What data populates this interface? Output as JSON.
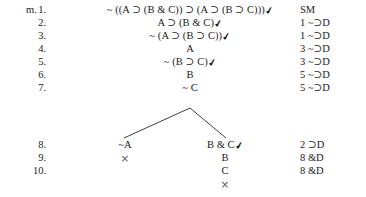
{
  "proof": {
    "tree_label": "m.",
    "checkmark_glyph": "✔",
    "close_glyph": "×",
    "stem_lines": [
      {
        "number": "1.",
        "formula": "~ ((A ⊃ (B & C)) ⊃ (A ⊃ (B ⊃ C)))",
        "checked": true,
        "justification": "SM"
      },
      {
        "number": "2.",
        "formula": "A ⊃ (B & C)",
        "checked": true,
        "justification": "1 ~⊃D"
      },
      {
        "number": "3.",
        "formula": "~ (A ⊃ (B ⊃ C))",
        "checked": true,
        "justification": "1 ~⊃D"
      },
      {
        "number": "4.",
        "formula": "A",
        "checked": false,
        "justification": "3 ~⊃D"
      },
      {
        "number": "5.",
        "formula": "~ (B ⊃ C)",
        "checked": true,
        "justification": "3 ~⊃D"
      },
      {
        "number": "6.",
        "formula": "B",
        "checked": false,
        "justification": "5 ~⊃D"
      },
      {
        "number": "7.",
        "formula": "~ C",
        "checked": false,
        "justification": "5 ~⊃D"
      }
    ],
    "branch_lines": [
      {
        "number": "8.",
        "left_formula": "~A",
        "left_checked": false,
        "right_formula": "B & C",
        "right_checked": true,
        "justification": "2 ⊃D"
      },
      {
        "number": "9.",
        "left_formula": "×",
        "left_checked": false,
        "right_formula": "B",
        "right_checked": false,
        "justification": "8 &D"
      },
      {
        "number": "10.",
        "left_formula": "",
        "left_checked": false,
        "right_formula": "C",
        "right_checked": false,
        "justification": "8 &D"
      }
    ],
    "right_branch_close": "×",
    "colors": {
      "ink": "#1a1a1a",
      "rule": "#2a2a2a",
      "background": "#ffffff"
    }
  }
}
